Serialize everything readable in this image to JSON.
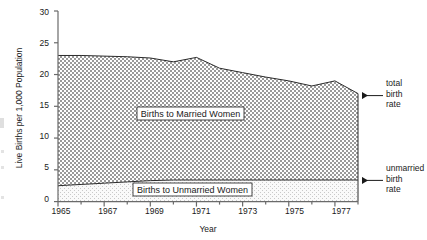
{
  "chart_data": {
    "type": "area",
    "title": "",
    "xlabel": "Year",
    "ylabel": "Live Births per 1,000 Population",
    "xlim": [
      1965,
      1978
    ],
    "ylim": [
      0,
      30
    ],
    "grid": false,
    "legend_position": "inside-plot",
    "x": [
      1965,
      1966,
      1967,
      1968,
      1969,
      1970,
      1971,
      1972,
      1973,
      1974,
      1975,
      1976,
      1977,
      1978
    ],
    "series": [
      {
        "name": "Births to Unmarried Women",
        "values": [
          2.5,
          2.7,
          2.9,
          3.1,
          3.3,
          3.4,
          3.4,
          3.4,
          3.4,
          3.4,
          3.4,
          3.4,
          3.4,
          3.4
        ]
      },
      {
        "name": "total birth rate",
        "values": [
          23.0,
          23.0,
          22.9,
          22.8,
          22.6,
          22.0,
          22.7,
          21.0,
          20.3,
          19.6,
          19.0,
          18.2,
          19.0,
          17.0
        ]
      }
    ],
    "y_ticks": [
      0,
      5,
      10,
      15,
      20,
      25,
      30
    ],
    "y_tick_labels": [
      "0",
      "5",
      "10",
      "15",
      "20",
      "25",
      "30"
    ],
    "x_ticks": [
      1965,
      1967,
      1969,
      1971,
      1973,
      1975,
      1977
    ],
    "x_tick_labels": [
      "1965",
      "1967",
      "1969",
      "1971",
      "1973",
      "1975",
      "1977"
    ],
    "x_minor_ticks": [
      1966,
      1968,
      1970,
      1972,
      1974,
      1976,
      1978
    ],
    "annotations": [
      {
        "name": "total-birth-rate",
        "text_lines": [
          "total",
          "birth",
          "rate"
        ],
        "points_to_year": 1978,
        "points_to_value": 17.0
      },
      {
        "name": "unmarried-birth-rate",
        "text_lines": [
          "unmarried",
          "birth",
          "rate"
        ],
        "points_to_year": 1978,
        "points_to_value": 3.4
      }
    ],
    "inline_labels": [
      {
        "name": "married-women-label",
        "text": "Births to Married Women"
      },
      {
        "name": "unmarried-women-label",
        "text": "Births to Unmarried Women"
      }
    ],
    "colors": {
      "line": "#2b2b2b",
      "married_fill": "#b0b0b0",
      "unmarried_fill": "#ececec",
      "axis": "#4a4a4a",
      "text": "#1a1a1a",
      "label_box_bg": "#ffffff"
    }
  },
  "axes": {
    "y_title": "Live Births per 1,000 Population",
    "x_title": "Year"
  },
  "annotations": {
    "total": {
      "line1": "total",
      "line2": "birth",
      "line3": "rate"
    },
    "unmarried": {
      "line1": "unmarried",
      "line2": "birth",
      "line3": "rate"
    }
  },
  "labels": {
    "married": "Births to Married Women",
    "unmarried": "Births to Unmarried Women"
  },
  "y_ticks": {
    "t0": "0",
    "t1": "5",
    "t2": "10",
    "t3": "15",
    "t4": "20",
    "t5": "25",
    "t6": "30"
  },
  "x_ticks": {
    "t0": "1965",
    "t1": "1967",
    "t2": "1969",
    "t3": "1971",
    "t4": "1973",
    "t5": "1975",
    "t6": "1977"
  }
}
